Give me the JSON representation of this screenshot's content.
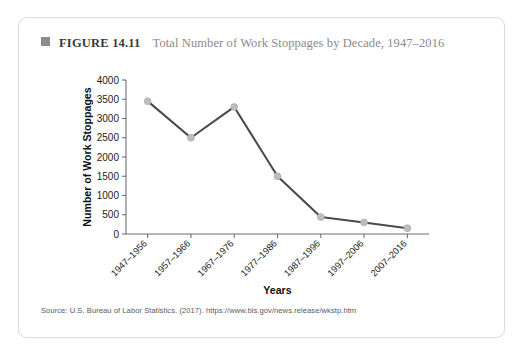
{
  "figure": {
    "marker_icon": "filled-square-icon",
    "number_label": "FIGURE 14.11",
    "title": "Total Number of Work Stoppages by Decade, 1947–2016",
    "source": "Source: U.S. Bureau of Labor Statistics. (2017). https://www.bls.gov/news.release/wkstp.htm"
  },
  "colors": {
    "line": "#4a4a4a",
    "marker": "#bdbdbd",
    "axis": "#6e6e6e",
    "card_border": "#d9d9d9",
    "title_text": "#8a8a8a",
    "number_text": "#3a3a3a"
  },
  "chart_data": {
    "type": "line",
    "title": "Total Number of Work Stoppages by Decade, 1947–2016",
    "xlabel": "Years",
    "ylabel": "Number of Work Stoppages",
    "categories": [
      "1947–1956",
      "1957–1966",
      "1967–1976",
      "1977–1986",
      "1987–1996",
      "1997–2006",
      "2007–2016"
    ],
    "values": [
      3450,
      2500,
      3300,
      1500,
      440,
      300,
      150
    ],
    "ylim": [
      0,
      4000
    ],
    "yticks": [
      0,
      500,
      1000,
      1500,
      2000,
      2500,
      3000,
      3500,
      4000
    ],
    "ytick_labels": [
      "0",
      "500",
      "1000",
      "1500",
      "2000",
      "2500",
      "3000",
      "3500",
      "4000"
    ],
    "grid": false,
    "legend": false,
    "marker": "circle",
    "xtick_rotation_deg": -45
  }
}
